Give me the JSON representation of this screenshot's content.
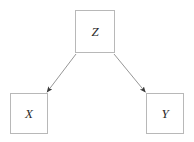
{
  "diagram": {
    "type": "causal-dag",
    "width": 194,
    "height": 142,
    "background_color": "#ffffff",
    "node_border_color": "#b8b8b8",
    "edge_color": "#8a8a8a",
    "arrowhead_color": "#3a3a3a",
    "label_color": "#2b2b2b",
    "nodes": [
      {
        "id": "z",
        "label": "Z",
        "shape": "square",
        "position": "top-center",
        "x": 75,
        "y": 10,
        "width": 40,
        "height": 43
      },
      {
        "id": "x",
        "label": "X",
        "shape": "square",
        "position": "bottom-left",
        "x": 10,
        "y": 93,
        "width": 38,
        "height": 41
      },
      {
        "id": "y",
        "label": "Y",
        "shape": "square",
        "position": "bottom-right",
        "x": 146,
        "y": 93,
        "width": 38,
        "height": 41
      }
    ],
    "edges": [
      {
        "id": "z-to-x",
        "from": "z",
        "to": "x",
        "label": "",
        "arrow": "single",
        "start_x": 76,
        "start_y": 54,
        "end_x": 48,
        "end_y": 93
      },
      {
        "id": "z-to-y",
        "from": "z",
        "to": "y",
        "label": "",
        "arrow": "single",
        "start_x": 114,
        "start_y": 54,
        "end_x": 146,
        "end_y": 93
      }
    ]
  }
}
